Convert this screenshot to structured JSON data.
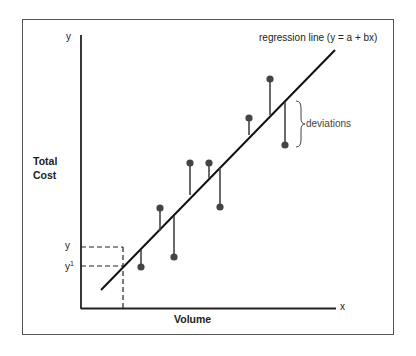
{
  "diagram": {
    "type": "regression-scatter",
    "axis_labels": {
      "y_axis_letter": "y",
      "x_axis_letter": "x",
      "y_axis_title_line1": "Total",
      "y_axis_title_line2": "Cost",
      "x_axis_title": "Volume"
    },
    "annotations": {
      "regression_line_label": "regression line (y = a + bx)",
      "deviations_label": "deviations",
      "y_marker": "y",
      "y_prime_marker": "y",
      "y_prime_superscript": "1"
    },
    "regression_line": {
      "x1": 101,
      "y1": 290,
      "x2": 335,
      "y2": 50
    },
    "points": [
      {
        "x": 141,
        "y": 267,
        "line_y": 250
      },
      {
        "x": 160,
        "y": 208,
        "line_y": 231
      },
      {
        "x": 174,
        "y": 257,
        "line_y": 216
      },
      {
        "x": 190,
        "y": 163,
        "line_y": 195
      },
      {
        "x": 209,
        "y": 163,
        "line_y": 178
      },
      {
        "x": 220,
        "y": 207,
        "line_y": 168
      },
      {
        "x": 249,
        "y": 118,
        "line_y": 135
      },
      {
        "x": 270,
        "y": 79,
        "line_y": 115
      },
      {
        "x": 285,
        "y": 145,
        "line_y": 102
      }
    ],
    "colors": {
      "line": "#111111",
      "point": "#444444",
      "text": "#222222",
      "frame": "#555555"
    }
  }
}
